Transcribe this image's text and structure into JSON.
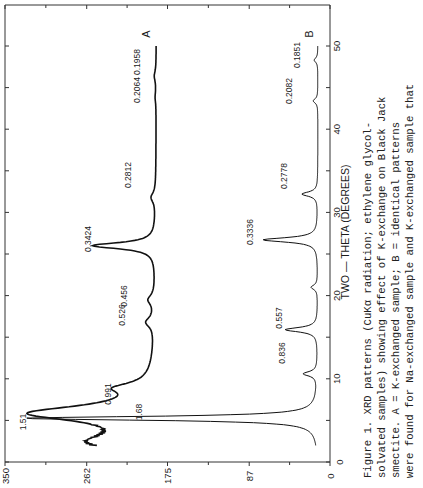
{
  "chart_data": {
    "type": "line",
    "orientation": "rotated 90 degrees counter-clockwise on page",
    "title": "",
    "xlabel": "TWO - THETA (DEGREES)",
    "ylabel": "",
    "xlim": [
      0,
      55
    ],
    "ylim": [
      0,
      350
    ],
    "x_ticks": [
      0,
      10,
      20,
      30,
      40,
      50
    ],
    "y_ticks": [
      0,
      87,
      175,
      262,
      350
    ],
    "grid": false,
    "series": [
      {
        "name": "A",
        "description": "K-exchanged sample",
        "peaks": [
          {
            "two_theta": 5.85,
            "intensity": 318,
            "label": "1.51"
          },
          {
            "two_theta": 8.9,
            "intensity": 218,
            "label": "0.991"
          },
          {
            "two_theta": 16.8,
            "intensity": 196,
            "label": "0.526"
          },
          {
            "two_theta": 19.5,
            "intensity": 194,
            "label": "0.456"
          },
          {
            "two_theta": 26.0,
            "intensity": 255,
            "label": "0.3424"
          },
          {
            "two_theta": 31.8,
            "intensity": 192,
            "label": "0.2812"
          },
          {
            "two_theta": 43.8,
            "intensity": 188,
            "label": "0.2064"
          },
          {
            "two_theta": 46.4,
            "intensity": 189,
            "label": "0.1958"
          }
        ],
        "baseline": 187,
        "start": {
          "two_theta": 2.0,
          "intensity": 247
        },
        "end": {
          "two_theta": 50.0,
          "intensity": 187
        }
      },
      {
        "name": "B",
        "description": "Na-exchanged sample after K-exchange (identical patterns)",
        "peaks": [
          {
            "two_theta": 5.25,
            "intensity": 330,
            "label": "1.68"
          },
          {
            "two_theta": 10.6,
            "intensity": 28,
            "label": "0.836"
          },
          {
            "two_theta": 15.9,
            "intensity": 48,
            "label": "0.557"
          },
          {
            "two_theta": 21.0,
            "intensity": 20,
            "label": ""
          },
          {
            "two_theta": 26.7,
            "intensity": 72,
            "label": "0.3336"
          },
          {
            "two_theta": 32.2,
            "intensity": 30,
            "label": "0.2778"
          },
          {
            "two_theta": 43.4,
            "intensity": 18,
            "label": "0.2082"
          },
          {
            "two_theta": 48.3,
            "intensity": 17,
            "label": "0.1851"
          }
        ],
        "baseline": 13,
        "start": {
          "two_theta": 2.0,
          "intensity": 13
        },
        "end": {
          "two_theta": 50.0,
          "intensity": 13
        }
      }
    ],
    "series_labels": [
      "A",
      "B"
    ]
  },
  "axes": {
    "intensity_ticks": [
      "350",
      "262",
      "175",
      "87",
      "0"
    ],
    "two_theta_ticks": [
      "0",
      "10",
      "20",
      "30",
      "40",
      "50"
    ],
    "two_theta_title": "TWO — THETA (DEGREES)"
  },
  "caption": {
    "lines": [
      "Figure 1.  XRD  patterns   (CuKα   radiation;   ethylene  glycol-",
      "solvated  samples) showing effect of  K-exchange on Black Jack",
      "smectite.  A  = K-exchanged  sample;  B  =  identical  patterns",
      "were  found for  Na-exchanged  sample and  K-exchanged sample that"
    ]
  }
}
